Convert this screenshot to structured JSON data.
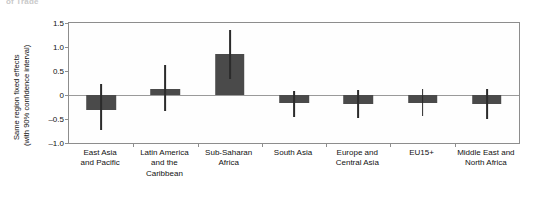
{
  "figure": {
    "clipped_header": "of Trade"
  },
  "chart_data": {
    "type": "bar",
    "title": "",
    "xlabel": "",
    "ylabel": "Same region fixed effects (with 90% confidence interval)",
    "ylabel_line1": "Same region fixed effects",
    "ylabel_line2": "(with 90% confidence interval)",
    "ylim": [
      -1.0,
      1.5
    ],
    "yticks": [
      1.5,
      1.0,
      0.5,
      0,
      -0.5,
      -1.0
    ],
    "ytick_labels": [
      "1.5",
      "1.0",
      "0.5",
      "0",
      "–0.5",
      "–1.0"
    ],
    "grid": false,
    "legend": "none",
    "zero_line": true,
    "error_bar_label": "90% confidence interval",
    "bar_color": "#4a4a4a",
    "error_bar_color": "#2b2b2b",
    "axis_color": "#8d8d8d",
    "categories": [
      "East Asia and Pacific",
      "Latin America and the Caribbean",
      "Sub-Saharan Africa",
      "South Asia",
      "Europe and Central Asia",
      "EU15+",
      "Middle East and North Africa"
    ],
    "category_lines": [
      [
        "East Asia",
        "and Pacific"
      ],
      [
        "Latin America",
        "and the",
        "Caribbean"
      ],
      [
        "Sub-Saharan",
        "Africa"
      ],
      [
        "South Asia"
      ],
      [
        "Europe and",
        "Central Asia"
      ],
      [
        "EU15+"
      ],
      [
        "Middle East and",
        "North Africa"
      ]
    ],
    "values": [
      -0.31,
      0.13,
      0.85,
      -0.17,
      -0.19,
      -0.16,
      -0.19
    ],
    "ci_low": [
      -0.72,
      -0.33,
      0.34,
      -0.45,
      -0.48,
      -0.44,
      -0.5
    ],
    "ci_high": [
      0.23,
      0.62,
      1.35,
      0.09,
      0.1,
      0.12,
      0.12
    ]
  }
}
